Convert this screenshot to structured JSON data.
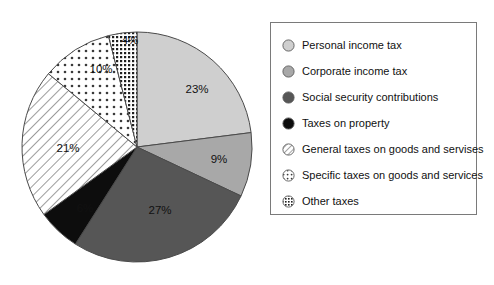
{
  "chart_data": {
    "type": "pie",
    "title": "",
    "subtitle": "",
    "xlabel": "",
    "ylabel": "",
    "legend_position": "right",
    "grid": false,
    "start_angle_deg": 0,
    "direction": "clockwise",
    "units": "percent",
    "categories": [
      "Personal income tax",
      "Corporate income tax",
      "Social security contributions",
      "Taxes on property",
      "General taxes on goods and servises",
      "Specific taxes on goods and services",
      "Other taxes"
    ],
    "values": [
      23,
      9,
      27,
      6,
      21,
      10,
      4
    ],
    "data_labels": [
      "23%",
      "9%",
      "27%",
      "6%",
      "21%",
      "10%",
      "4%"
    ],
    "slices": [
      {
        "label": "Personal income tax",
        "value": 23,
        "data_label": "23%",
        "fill_style": "solid",
        "color": "#cfcfcf",
        "label_x": 197,
        "label_y": 93
      },
      {
        "label": "Corporate income tax",
        "value": 9,
        "data_label": "9%",
        "fill_style": "solid",
        "color": "#a8a8a8",
        "label_x": 219,
        "label_y": 163
      },
      {
        "label": "Social security contributions",
        "value": 27,
        "data_label": "27%",
        "fill_style": "solid",
        "color": "#565656",
        "label_x": 160,
        "label_y": 214
      },
      {
        "label": "Taxes on property",
        "value": 6,
        "data_label": "6%",
        "fill_style": "solid",
        "color": "#0d0d0d",
        "label_x": 85,
        "label_y": 212
      },
      {
        "label": "General taxes on goods and servises",
        "value": 21,
        "data_label": "21%",
        "fill_style": "diagonal-hatch",
        "color": "#ffffff",
        "label_x": 68,
        "label_y": 152
      },
      {
        "label": "Specific taxes on goods and services",
        "value": 10,
        "data_label": "10%",
        "fill_style": "dots",
        "color": "#ffffff",
        "label_x": 101,
        "label_y": 73
      },
      {
        "label": "Other taxes",
        "value": 4,
        "data_label": "4%",
        "fill_style": "grid-check",
        "color": "#ffffff",
        "label_x": 130,
        "label_y": 44
      }
    ]
  },
  "pie": {
    "center_x": 137,
    "center_y": 147,
    "radius": 115,
    "outline_color": "#4a4a4a"
  },
  "legend": {
    "border_color": "#7a7a7a",
    "items": [
      {
        "label": "Personal income tax",
        "swatch": "circle-light-gray"
      },
      {
        "label": "Corporate income tax",
        "swatch": "circle-medium-gray"
      },
      {
        "label": "Social security contributions",
        "swatch": "circle-dark-gray"
      },
      {
        "label": "Taxes on property",
        "swatch": "circle-black"
      },
      {
        "label": "General taxes on goods and servises",
        "swatch": "circle-diagonal-hatch"
      },
      {
        "label": "Specific taxes on goods and services",
        "swatch": "circle-dots"
      },
      {
        "label": "Other taxes",
        "swatch": "circle-grid-check"
      }
    ]
  }
}
